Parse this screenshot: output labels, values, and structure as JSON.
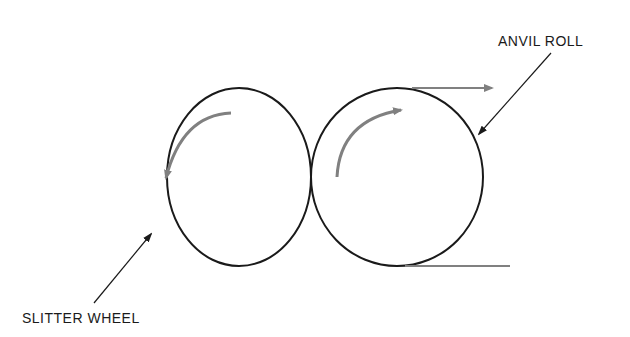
{
  "diagram": {
    "labels": {
      "anvil_roll": "ANVIL ROLL",
      "slitter_wheel": "SLITTER WHEEL"
    },
    "components": [
      {
        "name": "slitter-wheel",
        "rotation": "counterclockwise"
      },
      {
        "name": "anvil-roll",
        "rotation": "clockwise"
      }
    ],
    "material_flow": "left-to-right along top of anvil roll",
    "colors": {
      "outline": "#1a1a1a",
      "arrow": "#808080",
      "background": "#ffffff"
    }
  }
}
